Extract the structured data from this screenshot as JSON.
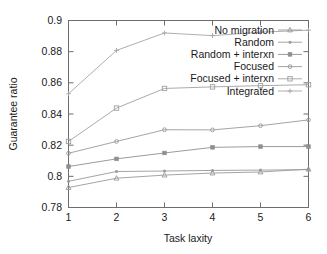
{
  "chart_data": {
    "type": "line",
    "title": "",
    "xlabel": "Task laxity",
    "ylabel": "Guarantee ratio",
    "x": [
      1,
      2,
      3,
      4,
      5,
      6
    ],
    "xlim": [
      1,
      6
    ],
    "ylim": [
      0.78,
      0.9
    ],
    "xticks": [
      "1",
      "2",
      "3",
      "4",
      "5",
      "6"
    ],
    "yticks": [
      "0.78",
      "0.8",
      "0.82",
      "0.84",
      "0.86",
      "0.88",
      "0.9"
    ],
    "ytick_values": [
      0.78,
      0.8,
      0.82,
      0.84,
      0.86,
      0.88,
      0.9
    ],
    "grid": false,
    "legend_position": "top-right-inside",
    "series": [
      {
        "name": "No migration",
        "marker": "triangle-up",
        "color": "#9a9a9a",
        "values": [
          0.7928,
          0.7988,
          0.8008,
          0.8021,
          0.8028,
          0.8046
        ]
      },
      {
        "name": "Random",
        "marker": "dot",
        "color": "#9a9a9a",
        "values": [
          0.7968,
          0.8031,
          0.8034,
          0.8038,
          0.804,
          0.8043
        ]
      },
      {
        "name": "Random + interxn",
        "marker": "square-filled",
        "color": "#8f8f8f",
        "values": [
          0.8063,
          0.8112,
          0.815,
          0.8186,
          0.8191,
          0.8191
        ]
      },
      {
        "name": "Focused",
        "marker": "dot-open",
        "color": "#9a9a9a",
        "values": [
          0.8148,
          0.8224,
          0.8299,
          0.8298,
          0.8325,
          0.8362
        ]
      },
      {
        "name": "Focused + interxn",
        "marker": "square-open",
        "color": "#a0a0a0",
        "values": [
          0.8224,
          0.8438,
          0.8564,
          0.8574,
          0.8582,
          0.8588
        ]
      },
      {
        "name": "Integrated",
        "marker": "plus",
        "color": "#a5a5a5",
        "values": [
          0.853,
          0.8808,
          0.892,
          0.8903,
          0.8925,
          0.8938
        ]
      }
    ]
  },
  "legend": {
    "entries": [
      {
        "label": "No migration"
      },
      {
        "label": "Random"
      },
      {
        "label": "Random + interxn"
      },
      {
        "label": "Focused"
      },
      {
        "label": "Focused + interxn"
      },
      {
        "label": "Integrated"
      }
    ]
  }
}
